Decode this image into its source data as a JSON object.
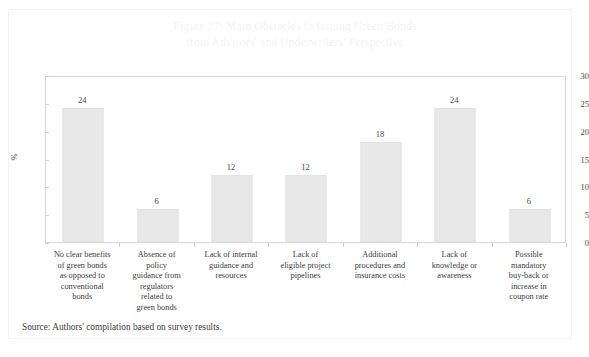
{
  "figure": {
    "title_line1": "Figure 27: Main Obstacles to Issuing Green Bonds",
    "title_line2": "from Advisors' and Underwriters' Perspective",
    "title_full": "Figure 27: Main Obstacles to Issuing Green Bonds\nfrom Advisors' and Underwriters' Perspective",
    "source_note": "Source: Authors' compilation based on survey results."
  },
  "colors": {
    "bar_fill": "#e8e8e8",
    "bar_border": "#e2e2e2",
    "plot_border": "#d9d9d9",
    "title_text": "#f3f3f3",
    "body_text": "#3d3d3d",
    "tick_text": "#4a4a4a"
  },
  "chart_data": {
    "type": "bar",
    "title": "Figure 27: Main Obstacles to Issuing Green Bonds from Advisors' and Underwriters' Perspective",
    "xlabel": "",
    "ylabel": "%",
    "ylim": [
      0,
      30
    ],
    "yticks": [
      0,
      5,
      10,
      15,
      20,
      25,
      30
    ],
    "ytick_labels": [
      "0",
      "5",
      "10",
      "15",
      "20",
      "25",
      "30"
    ],
    "grid": false,
    "legend": "none",
    "categories": [
      "No clear benefits of green bonds as opposed to conventional bonds",
      "Absence of policy guidance from regulators related to green bonds",
      "Lack of internal guidance and resources",
      "Lack of eligible project pipelines",
      "Additional procedures and insurance costs",
      "Lack of knowledge or awareness",
      "Possible mandatory buy-back or increase in coupon rate"
    ],
    "category_lines": [
      [
        "No clear benefits",
        "of green bonds",
        "as opposed to",
        "conventional",
        "bonds"
      ],
      [
        "Absence of",
        "policy",
        "guidance from",
        "regulators",
        "related to",
        "green bonds"
      ],
      [
        "Lack of internal",
        "guidance and",
        "resources"
      ],
      [
        "Lack of",
        "eligible project",
        "pipelines"
      ],
      [
        "Additional",
        "procedures and",
        "insurance costs"
      ],
      [
        "Lack of",
        "knowledge or",
        "awareness"
      ],
      [
        "Possible",
        "mandatory",
        "buy-back or",
        "increase in",
        "coupon rate"
      ]
    ],
    "values": [
      24,
      6,
      12,
      12,
      18,
      24,
      6
    ],
    "value_labels": [
      "24",
      "6",
      "12",
      "12",
      "18",
      "24",
      "6"
    ]
  }
}
